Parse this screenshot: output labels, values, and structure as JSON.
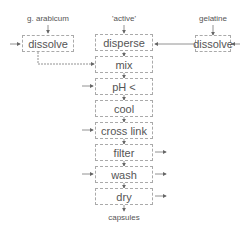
{
  "inputs": {
    "left": "g. arabicum",
    "center": "'active'",
    "right": "gelatine"
  },
  "side_boxes": {
    "left": "dissolve",
    "right": "dissolve"
  },
  "steps": [
    "disperse",
    "mix",
    "pH <",
    "cool",
    "cross link",
    "filter",
    "wash",
    "dry"
  ],
  "output": "capsules",
  "colors": {
    "line": "#666666",
    "box_border": "#aaaaaa",
    "text": "#555555"
  }
}
